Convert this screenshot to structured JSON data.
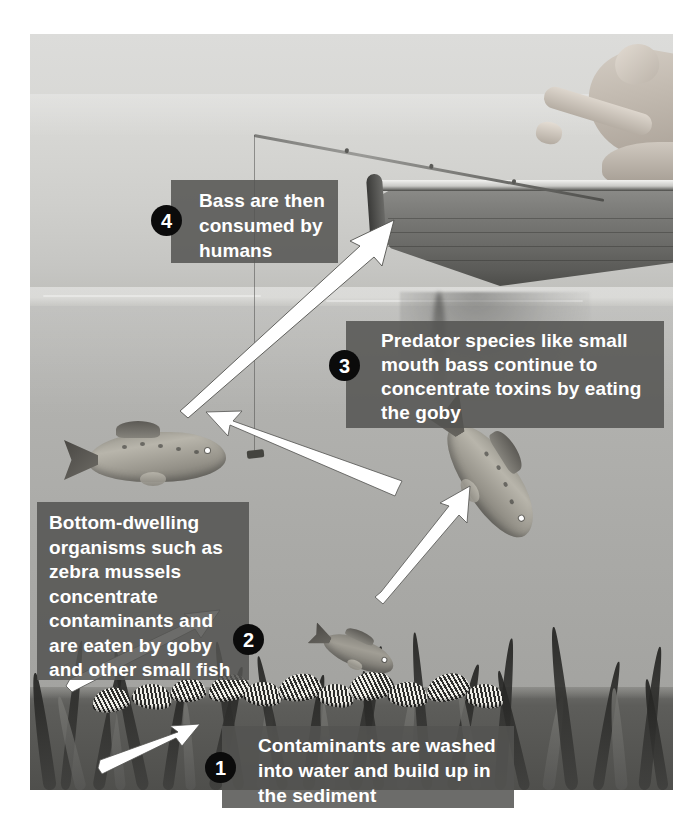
{
  "figure": {
    "kind": "illustrated-diagram",
    "scene_elements": [
      "angler",
      "rowboat",
      "fishing-rod",
      "fishing-line",
      "lure",
      "smallmouth-bass",
      "round-goby",
      "aquatic-weeds",
      "zebra-mussels",
      "lake-sediment",
      "water-surface"
    ]
  },
  "colors": {
    "caption_background": "#545452",
    "caption_text": "#ffffff",
    "badge_background": "#0b0b0b",
    "badge_text": "#ffffff",
    "arrow_fill": "#ffffff",
    "arrow_outline": "#3c3c3a",
    "sky": "#d7d7d4",
    "water": "#b0b0ad",
    "sediment": "#565653"
  },
  "captions": [
    {
      "number": "1",
      "text": "Contaminants are washed\ninto water and build up in\nthe sediment"
    },
    {
      "number": "2",
      "text": "Bottom-dwelling\norganisms such as\nzebra mussels\nconcentrate\ncontaminants and\nare eaten by goby\nand other small fish"
    },
    {
      "number": "3",
      "text": "Predator species like small\nmouth bass continue to\nconcentrate toxins by eating\nthe goby"
    },
    {
      "number": "4",
      "text": "Bass are then\nconsumed by\nhumans"
    }
  ],
  "arrows": [
    {
      "name": "runoff-to-sediment",
      "from": "lower-left-water",
      "to": "lake-bed"
    },
    {
      "name": "mussels-to-goby",
      "from": "zebra-mussel-bed",
      "to": "goby"
    },
    {
      "name": "goby-to-bass",
      "from": "goby",
      "to": "diagonal-bass"
    },
    {
      "name": "bass-to-bass",
      "from": "diagonal-bass",
      "to": "left-bass"
    },
    {
      "name": "bass-to-boat",
      "from": "lure-area",
      "to": "boat-bow"
    }
  ]
}
